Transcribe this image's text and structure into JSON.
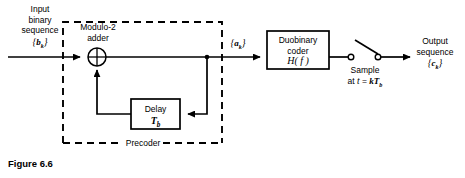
{
  "figure": {
    "caption": "Figure 6.6"
  },
  "labels": {
    "input_line1": "Input",
    "input_line2": "binary",
    "input_line3": "sequence",
    "input_symbol_open": "{",
    "input_symbol_var": "b",
    "input_symbol_sub": "k",
    "input_symbol_close": "}",
    "adder_line1": "Modulo-2",
    "adder_line2": "adder",
    "precoder": "Precoder",
    "delay_line1": "Delay",
    "delay_symbol_var": "T",
    "delay_symbol_sub": "b",
    "coder_line1": "Duobinary",
    "coder_line2": "coder",
    "coder_symbol_fn": "H",
    "coder_symbol_arg": "( f )",
    "mid_symbol_open": "{",
    "mid_symbol_var": "a",
    "mid_symbol_sub": "k",
    "mid_symbol_close": "}",
    "sample_line1": "Sample",
    "sample_line2_prefix": "at ",
    "sample_line2_t": "t",
    "sample_line2_eq": " = ",
    "sample_line2_k": "kT",
    "sample_line2_sub": "b",
    "output_line1": "Output",
    "output_line2": "sequence",
    "output_symbol_open": "{",
    "output_symbol_var": "c",
    "output_symbol_sub": "k",
    "output_symbol_close": "}"
  },
  "colors": {
    "stroke": "#000000",
    "background": "#ffffff"
  },
  "geometry": {
    "signal_line_y": 57,
    "adder_center_x": 97,
    "adder_center_y": 57,
    "adder_radius": 9,
    "precoder_box": {
      "x": 63,
      "y": 22,
      "w": 159,
      "h": 121
    },
    "delay_box": {
      "x": 131,
      "y": 99,
      "w": 49,
      "h": 30
    },
    "coder_box": {
      "x": 267,
      "y": 31,
      "w": 62,
      "h": 38
    },
    "feedback_tap_x": 207,
    "feedback_y": 114,
    "switch_left_x": 350,
    "switch_right_x": 378,
    "output_arrow_x": 408
  }
}
